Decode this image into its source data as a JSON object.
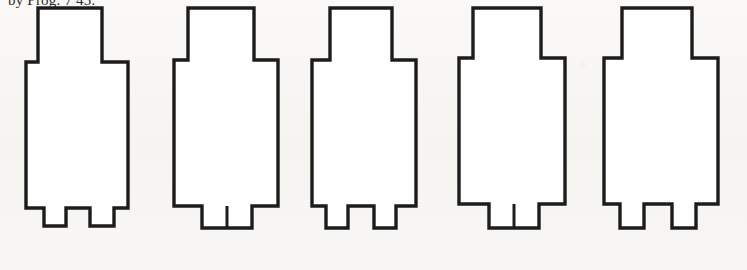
{
  "figure": {
    "caption": "by Prog. 7 45.",
    "type": "technical-line-drawing",
    "background_color": "#f7f6f4",
    "stroke_color": "#1c1c1c",
    "fill_color": "#ffffff",
    "canvas": {
      "width": 747,
      "height": 270
    }
  },
  "shapes": [
    {
      "index": 1,
      "name": "floorplan-outline-1",
      "label": "Plan 1",
      "foot_type": "two-separated-tabs",
      "offset_x": 18,
      "width": 130,
      "path": "M 20 8 L 84 8 L 84 62 L 110 62 L 110 208 L 96 208 L 96 226 L 72 226 L 72 208 L 48 208 L 48 226 L 26 226 L 26 208 L 8 208 L 8 62 L 20 62 Z",
      "slit": null
    },
    {
      "index": 2,
      "name": "floorplan-outline-2",
      "label": "Plan 2",
      "foot_type": "single-tab-with-slit",
      "offset_x": 158,
      "width": 136,
      "path": "M 30 8 L 96 8 L 96 60 L 120 60 L 120 206 L 94 206 L 94 228 L 44 228 L 44 206 L 16 206 L 16 60 L 30 60 Z",
      "slit": {
        "x": 69,
        "y1": 206,
        "y2": 228
      }
    },
    {
      "index": 3,
      "name": "floorplan-outline-3",
      "label": "Plan 3",
      "foot_type": "two-separated-tabs",
      "offset_x": 298,
      "width": 134,
      "path": "M 32 8 L 94 8 L 94 60 L 118 60 L 118 206 L 98 206 L 98 228 L 76 228 L 76 206 L 50 206 L 50 228 L 28 228 L 28 206 L 14 206 L 14 60 L 32 60 Z",
      "slit": null
    },
    {
      "index": 4,
      "name": "floorplan-outline-4",
      "label": "Plan 4",
      "foot_type": "single-tab-with-slit",
      "offset_x": 437,
      "width": 140,
      "path": "M 36 8 L 104 8 L 104 58 L 128 58 L 128 204 L 102 204 L 102 228 L 52 228 L 52 204 L 22 204 L 22 58 L 36 58 Z",
      "slit": {
        "x": 77,
        "y1": 204,
        "y2": 228
      }
    },
    {
      "index": 5,
      "name": "floorplan-outline-5",
      "label": "Plan 5",
      "foot_type": "two-separated-tabs",
      "offset_x": 582,
      "width": 150,
      "path": "M 40 8 L 110 8 L 110 58 L 136 58 L 136 204 L 114 204 L 114 228 L 90 228 L 90 204 L 62 204 L 62 228 L 38 228 L 38 204 L 22 204 L 22 58 L 40 58 Z",
      "slit": null
    }
  ]
}
